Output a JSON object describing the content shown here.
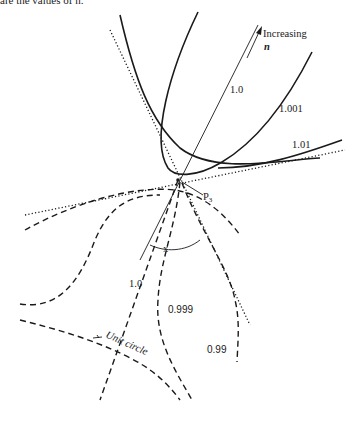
{
  "caption_fragment": "are the values of n.",
  "diagram": {
    "arrow_label_line1": "Increasing",
    "arrow_label_line2": "n",
    "point_label": "P",
    "point_subscript": "3",
    "angle_label": "x",
    "solid_curve_labels": [
      "1.0",
      "1.001",
      "1.01"
    ],
    "dashed_curve_labels": [
      "1.0",
      "0.999",
      "0.99"
    ],
    "unit_circle_label": "Unit circle"
  }
}
